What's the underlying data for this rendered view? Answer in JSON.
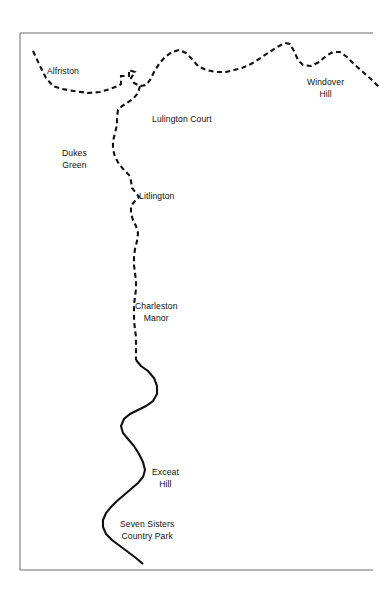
{
  "figure": {
    "kind": "map",
    "background_color": "#ffffff",
    "border_color": "#6b6b6b",
    "route_color": "#101010"
  },
  "frame": {
    "name": "map-border",
    "x": 20,
    "y": 33,
    "width": 353,
    "height": 537,
    "top_edge": true,
    "left_edge": true,
    "bottom_edge": true,
    "right_edge": false
  },
  "labels": [
    {
      "id": "alfriston",
      "text": "Alfriston",
      "lines": [
        "Alfriston"
      ],
      "x": 47,
      "y": 66,
      "align": "left"
    },
    {
      "id": "windover-hill",
      "text": "Windover Hill",
      "lines": [
        "Windover",
        "Hill"
      ],
      "x": 307,
      "y": 77,
      "align": "center"
    },
    {
      "id": "lulington-court",
      "text": "Lulington Court",
      "lines": [
        "Lulington Court"
      ],
      "x": 152,
      "y": 114,
      "align": "left"
    },
    {
      "id": "dukes-green",
      "text": "Dukes Green",
      "lines": [
        "Dukes",
        "Green"
      ],
      "x": 62,
      "y": 148,
      "align": "center"
    },
    {
      "id": "litlington",
      "text": "Litlington",
      "lines": [
        "Litlington"
      ],
      "x": 139,
      "y": 191,
      "align": "left"
    },
    {
      "id": "charleston-manor",
      "text": "Charleston Manor",
      "lines": [
        "Charleston",
        "Manor"
      ],
      "x": 135,
      "y": 301,
      "align": "center"
    },
    {
      "id": "exceat-hill",
      "text": "Exceat Hill",
      "lines": [
        "Exceat",
        "Hill"
      ],
      "x": 152,
      "y": 467,
      "align": "center"
    },
    {
      "id": "seven-sisters-cp",
      "text": "Seven Sisters Country Park",
      "lines": [
        "Seven Sisters",
        "Country Park"
      ],
      "x": 120,
      "y": 519,
      "align": "center"
    }
  ],
  "route": {
    "name": "route-line",
    "stroke_width": 2.1,
    "segments": [
      {
        "id": "northern-ridge-dashed",
        "style": "dashed",
        "dash": "5,3.4",
        "description": "Dashed ridge boundary running from upper-left across the top to Windover Hill and off the right edge",
        "path": "M 33 51 L 40 66 L 46 78 L 53 86 L 62 89 L 74 91 L 88 93 L 100 92 L 110 89 L 118 86 L 121 84 L 121 76 L 129 76 L 129 70 L 135 72 L 131 78 L 134 83 L 140 86 L 146 85 L 150 80 L 154 72 L 159 64 L 165 57 L 172 52 L 179 50 L 186 53 L 192 59 L 198 66 L 206 70 L 216 72 L 226 72 L 234 70 L 242 68 L 251 64 L 259 59 L 268 53 L 277 47 L 285 43 L 290 44 L 294 51 L 298 60 L 303 65 L 311 66 L 319 62 L 326 56 L 333 52 L 340 52 L 347 57 L 355 65 L 363 72 L 372 80 L 380 88"
      },
      {
        "id": "lulington-spur-dashed",
        "style": "dashed",
        "dash": "5,3.4",
        "description": "Dashed spur dropping south from the Alfriston notch past Dukes Green and Litlington",
        "path": "M 140 86 L 138 93 L 133 99 L 127 103 L 122 106 L 118 110 L 117 117 L 117 125 L 115 133 L 113 141 L 113 149 L 115 157 L 119 164 L 124 170 L 129 175 L 131 181 L 132 188 L 136 193 L 139 197 L 135 201 L 131 206 L 131 213 L 133 220 L 136 226 L 138 233 L 137 241 L 135 249 L 134 257 L 134 265 L 135 273 L 136 281 L 136 289 L 135 297 L 134 305 L 134 313 L 134 321 L 135 329 L 136 337 L 136 345 L 136 353 L 136 360"
      },
      {
        "id": "cuckmere-meander-solid",
        "style": "solid",
        "description": "Solid river/valley line meandering south through Exceat Hill to Seven Sisters Country Park",
        "path": "M 136 360 L 141 366 L 148 371 L 154 378 L 157 386 L 157 394 L 153 401 L 146 406 L 138 410 L 130 414 L 124 419 L 121 426 L 123 433 L 128 439 L 134 446 L 139 454 L 143 462 L 145 470 L 143 477 L 138 483 L 131 489 L 124 495 L 117 501 L 111 507 L 106 513 L 103 520 L 103 527 L 106 534 L 112 540 L 120 546 L 128 552 L 136 558 L 143 564"
      }
    ]
  }
}
